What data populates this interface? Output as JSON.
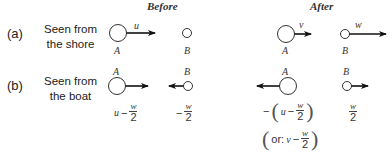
{
  "headers": {
    "before": "Before",
    "after": "After"
  },
  "rows": [
    {
      "id": "a",
      "tag": "(a)",
      "caption_line1": "Seen from",
      "caption_line2": "the shore",
      "before": {
        "A": {
          "label": "A",
          "velocity_label": "u",
          "direction": "right"
        },
        "B": {
          "label": "B",
          "velocity_label": "",
          "direction": "none"
        }
      },
      "after": {
        "A": {
          "label": "A",
          "velocity_label": "v",
          "direction": "right"
        },
        "B": {
          "label": "B",
          "velocity_label": "w",
          "direction": "right"
        }
      }
    },
    {
      "id": "b",
      "tag": "(b)",
      "caption_line1": "Seen from",
      "caption_line2": "the boat",
      "before": {
        "A": {
          "label": "A",
          "direction": "right",
          "expr_var": "u",
          "expr_op": "−",
          "expr_num": "w",
          "expr_den": "2"
        },
        "B": {
          "label": "B",
          "direction": "left",
          "expr_op": "−",
          "expr_num": "w",
          "expr_den": "2"
        }
      },
      "after": {
        "A": {
          "label": "A",
          "direction": "left",
          "expr_prefix": "−",
          "expr_var": "u",
          "expr_op": "−",
          "expr_num": "w",
          "expr_den": "2",
          "alt_prefix": "or:",
          "alt_var": "v",
          "alt_op": "−",
          "alt_num": "w",
          "alt_den": "2"
        },
        "B": {
          "label": "B",
          "direction": "right",
          "expr_num": "w",
          "expr_den": "2"
        }
      }
    }
  ],
  "colors": {
    "stroke": "#333333",
    "arrow": "#111111"
  }
}
